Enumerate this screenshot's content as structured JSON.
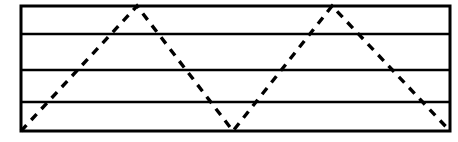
{
  "figure": {
    "title": "Dashed zigzag path over a ruled rectangle",
    "background_color": "#ffffff",
    "ink_color": "#000000",
    "canvas": {
      "width": 458,
      "height": 142
    }
  },
  "chart_data": {
    "type": "line",
    "title": "Dashed zigzag path over a ruled rectangle",
    "xlabel": "",
    "ylabel": "",
    "xlim": [
      21,
      450
    ],
    "ylim": [
      131,
      6
    ],
    "grid": true,
    "legend_position": "none",
    "axis_ticks": {
      "x": [],
      "y": []
    },
    "frame": {
      "name": "outer-rectangle",
      "x": 21,
      "y": 6,
      "width": 429,
      "height": 125,
      "stroke_color": "#000000",
      "stroke_width": 3,
      "dashed": false
    },
    "gridlines": {
      "orientation": "horizontal",
      "stroke_color": "#000000",
      "stroke_width": 2.6,
      "dashed": false,
      "y_values": [
        34,
        70,
        102
      ],
      "count": 3,
      "band_count": 4
    },
    "series": [
      {
        "name": "dashed-zigzag",
        "dashed": true,
        "dash_length": 8,
        "dash_gap": 7,
        "stroke_color": "#000000",
        "stroke_width": 3.4,
        "x": [
          21,
          137,
          233,
          332,
          450
        ],
        "y": [
          131,
          6,
          131,
          6,
          131
        ],
        "vertex_kinds": [
          "start-bottom-left",
          "peak",
          "valley",
          "peak",
          "end-bottom-right"
        ]
      }
    ],
    "annotations": []
  }
}
